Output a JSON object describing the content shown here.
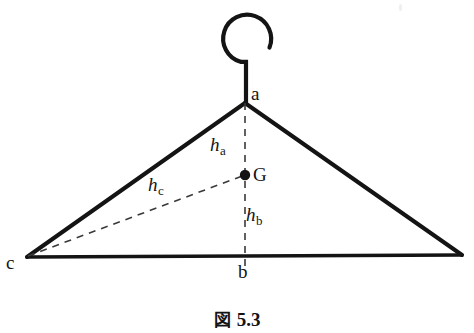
{
  "figure": {
    "caption_kanji": "図",
    "caption_number": "5.3",
    "background_color": "#ffffff",
    "stroke_color": "#141414"
  },
  "vertices": {
    "apex": {
      "label": "a",
      "x": 245,
      "y": 103
    },
    "foot": {
      "label": "b",
      "x": 245,
      "y": 256
    },
    "left": {
      "label": "c",
      "x": 27,
      "y": 257
    },
    "right": {
      "label": "",
      "x": 462,
      "y": 255
    }
  },
  "centroid": {
    "label": "G",
    "x": 245,
    "y": 175,
    "dot_radius": 5
  },
  "distances": [
    {
      "name": "h_a",
      "base": "h",
      "sub": "a",
      "x": 210,
      "y": 135
    },
    {
      "name": "h_b",
      "base": "h",
      "sub": "b",
      "x": 246,
      "y": 205
    },
    {
      "name": "h_c",
      "base": "h",
      "sub": "c",
      "x": 148,
      "y": 175
    }
  ],
  "hook": {
    "center_x": 246,
    "center_y": 38,
    "radius": 24,
    "stem_top_y": 62,
    "stem_bottom_y": 103
  },
  "line_styles": {
    "solid_width": 4,
    "hook_width": 4.2,
    "dashed_width": 1.6,
    "dash_pattern": "7 6"
  }
}
